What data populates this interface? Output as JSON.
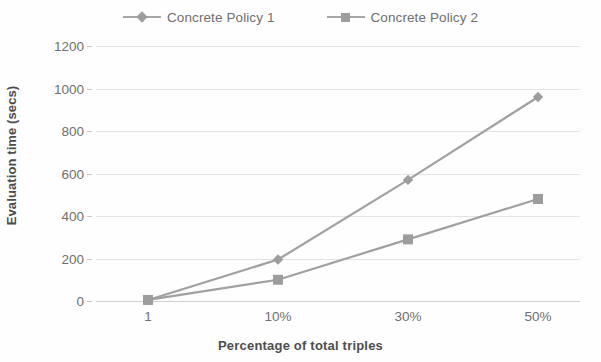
{
  "chart_data": {
    "type": "line",
    "title": "",
    "xlabel": "Percentage of total triples",
    "ylabel": "Evaluation time (secs)",
    "categories": [
      "1",
      "10%",
      "30%",
      "50%"
    ],
    "series": [
      {
        "name": "Concrete Policy 1",
        "marker": "diamond",
        "color": "#a0a0a0",
        "values": [
          5,
          195,
          570,
          960
        ]
      },
      {
        "name": "Concrete Policy 2",
        "marker": "square",
        "color": "#a0a0a0",
        "values": [
          5,
          100,
          290,
          480
        ]
      }
    ],
    "ylim": [
      0,
      1200
    ],
    "y_ticks": [
      0,
      200,
      400,
      600,
      800,
      1000,
      1200
    ],
    "y_tick_labels": [
      "0",
      "200",
      "400",
      "600",
      "800",
      "1000",
      "1200"
    ],
    "grid": true,
    "legend_position": "top"
  },
  "legend": {
    "entries": [
      {
        "label": "Concrete Policy 1"
      },
      {
        "label": "Concrete Policy 2"
      }
    ]
  },
  "axes": {
    "y_title": "Evaluation time (secs)",
    "x_title": "Percentage of total triples"
  },
  "colors": {
    "series_line": "#a0a0a0",
    "marker": "#9d9d9d",
    "gridline": "#e3e3e3",
    "axis_text": "#6f6f6f",
    "title_text": "#4d4d4d",
    "background": "#fefefe"
  }
}
